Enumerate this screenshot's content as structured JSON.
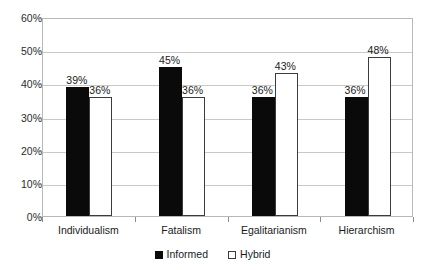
{
  "chart_data": {
    "type": "bar",
    "title": "",
    "xlabel": "",
    "ylabel": "",
    "categories": [
      "Individualism",
      "Fatalism",
      "Egalitarianism",
      "Hierarchism"
    ],
    "series": [
      {
        "name": "Informed",
        "values": [
          39,
          45,
          36,
          36
        ],
        "color": "#0a0a0a",
        "fill": "solid"
      },
      {
        "name": "Hybrid",
        "values": [
          36,
          36,
          43,
          48
        ],
        "color": "#ffffff",
        "fill": "hollow"
      }
    ],
    "value_labels": [
      [
        "39%",
        "36%"
      ],
      [
        "45%",
        "36%"
      ],
      [
        "36%",
        "43%"
      ],
      [
        "36%",
        "48%"
      ]
    ],
    "ylim": [
      0,
      60
    ],
    "ytick_values": [
      0,
      10,
      20,
      30,
      40,
      50,
      60
    ],
    "ytick_labels": [
      "0%",
      "10%",
      "20%",
      "30%",
      "40%",
      "50%",
      "60%"
    ],
    "grid": true,
    "grid_axis": "y",
    "legend_position": "bottom",
    "units": "percent"
  },
  "legend": {
    "entries": [
      {
        "label": "Informed",
        "swatch": "filled-square-icon"
      },
      {
        "label": "Hybrid",
        "swatch": "hollow-square-icon"
      }
    ]
  }
}
